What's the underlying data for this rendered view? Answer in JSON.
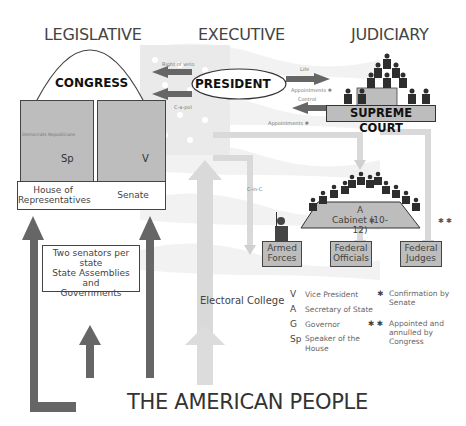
{
  "headings": {
    "legislative": "LEGISLATIVE",
    "executive": "EXECUTIVE",
    "judiciary": "JUDICIARY",
    "people": "THE AMERICAN PEOPLE"
  },
  "congress": {
    "title": "CONGRESS",
    "house": {
      "label_line1": "House of",
      "label_line2": "Representatives",
      "parties": "Democrats  Republicans",
      "leader_code": "Sp"
    },
    "senate": {
      "label": "Senate",
      "leader_code": "V"
    }
  },
  "president": {
    "label": "PRESIDENT",
    "arrows": {
      "veto": "Right of veto",
      "cpt": "C-a-pol",
      "life": "Life",
      "appointments_court": "Appointments",
      "control": "Control",
      "appointments_exec": "Appointments",
      "cinc": "C-in-C"
    }
  },
  "supreme_court": {
    "label": "SUPREME COURT"
  },
  "cabinet": {
    "code": "A",
    "label": "Cabinet (10-12)"
  },
  "subordinates": [
    {
      "line1": "Armed",
      "line2": "Forces"
    },
    {
      "line1": "Federal",
      "line2": "Officials"
    },
    {
      "line1": "Federal",
      "line2": "Judges"
    }
  ],
  "markers": {
    "single": "✱",
    "double": "✱ ✱"
  },
  "state_box": {
    "line1": "Two senators per state",
    "line2": "State Assemblies and",
    "line3": "Governments"
  },
  "electoral_college": "Electoral College",
  "legend": {
    "codes": [
      {
        "code": "V",
        "meaning": "Vice President"
      },
      {
        "code": "A",
        "meaning": "Secretary of State"
      },
      {
        "code": "G",
        "meaning": "Governor"
      },
      {
        "code": "Sp",
        "meaning_line1": "Speaker of the",
        "meaning_line2": "House"
      }
    ],
    "symbols": [
      {
        "symbol": "✱",
        "line1": "Confirmation by",
        "line2": "Senate"
      },
      {
        "symbol": "✱ ✱",
        "line1": "Appointed and",
        "line2": "annulled by",
        "line3": "Congress"
      }
    ]
  },
  "colors": {
    "dark_arrow": "#666666",
    "light_arrow": "#d9d9d9",
    "box_fill": "#bdbdbd",
    "figure": "#2e2e2e"
  }
}
